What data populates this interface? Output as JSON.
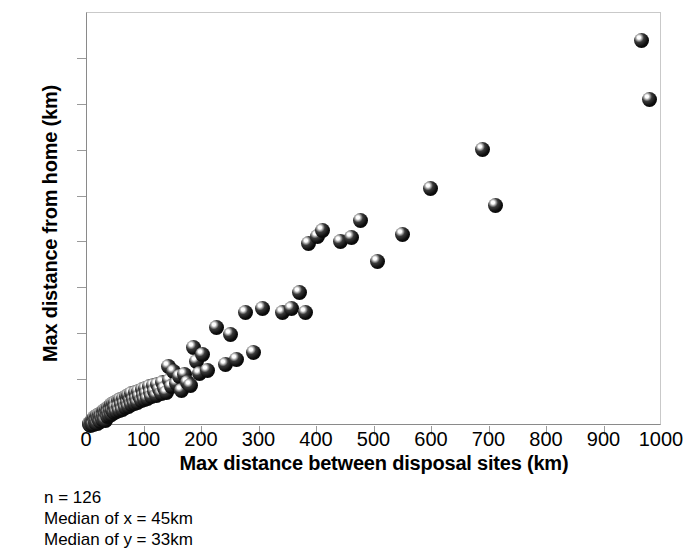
{
  "chart_data": {
    "type": "scatter",
    "title": "",
    "xlabel": "Max distance between disposal sites (km)",
    "ylabel": "Max distance from home (km)",
    "xlim": [
      0,
      1000
    ],
    "ylim": [
      0,
      900
    ],
    "xticks": [
      0,
      100,
      200,
      300,
      400,
      500,
      600,
      700,
      800,
      900,
      1000
    ],
    "yticks": [
      0,
      100,
      200,
      300,
      400,
      500,
      600,
      700,
      800,
      900
    ],
    "grid": false,
    "legend": null,
    "marker_style": "black-3d-sphere",
    "n_points": 126,
    "points": [
      [
        4,
        3
      ],
      [
        5,
        6
      ],
      [
        6,
        2
      ],
      [
        7,
        9
      ],
      [
        8,
        5
      ],
      [
        9,
        12
      ],
      [
        10,
        7
      ],
      [
        11,
        15
      ],
      [
        12,
        4
      ],
      [
        13,
        18
      ],
      [
        14,
        10
      ],
      [
        15,
        8
      ],
      [
        16,
        20
      ],
      [
        17,
        13
      ],
      [
        18,
        6
      ],
      [
        19,
        22
      ],
      [
        20,
        16
      ],
      [
        21,
        11
      ],
      [
        22,
        25
      ],
      [
        23,
        18
      ],
      [
        24,
        9
      ],
      [
        25,
        28
      ],
      [
        26,
        20
      ],
      [
        27,
        14
      ],
      [
        28,
        31
      ],
      [
        29,
        22
      ],
      [
        30,
        17
      ],
      [
        31,
        34
      ],
      [
        32,
        25
      ],
      [
        33,
        12
      ],
      [
        34,
        37
      ],
      [
        35,
        27
      ],
      [
        36,
        20
      ],
      [
        37,
        40
      ],
      [
        38,
        30
      ],
      [
        39,
        23
      ],
      [
        40,
        43
      ],
      [
        41,
        33
      ],
      [
        42,
        26
      ],
      [
        43,
        46
      ],
      [
        44,
        35
      ],
      [
        45,
        33
      ],
      [
        46,
        49
      ],
      [
        47,
        38
      ],
      [
        48,
        29
      ],
      [
        49,
        52
      ],
      [
        50,
        40
      ],
      [
        52,
        31
      ],
      [
        54,
        55
      ],
      [
        55,
        43
      ],
      [
        57,
        34
      ],
      [
        58,
        58
      ],
      [
        60,
        46
      ],
      [
        62,
        37
      ],
      [
        63,
        61
      ],
      [
        65,
        49
      ],
      [
        67,
        40
      ],
      [
        68,
        64
      ],
      [
        70,
        52
      ],
      [
        72,
        43
      ],
      [
        73,
        67
      ],
      [
        75,
        55
      ],
      [
        77,
        46
      ],
      [
        78,
        70
      ],
      [
        80,
        58
      ],
      [
        82,
        49
      ],
      [
        84,
        73
      ],
      [
        86,
        61
      ],
      [
        88,
        52
      ],
      [
        90,
        76
      ],
      [
        92,
        64
      ],
      [
        94,
        55
      ],
      [
        96,
        79
      ],
      [
        98,
        67
      ],
      [
        100,
        58
      ],
      [
        102,
        82
      ],
      [
        104,
        70
      ],
      [
        106,
        61
      ],
      [
        108,
        85
      ],
      [
        110,
        73
      ],
      [
        112,
        64
      ],
      [
        115,
        88
      ],
      [
        118,
        76
      ],
      [
        120,
        67
      ],
      [
        123,
        91
      ],
      [
        126,
        79
      ],
      [
        129,
        70
      ],
      [
        132,
        94
      ],
      [
        135,
        82
      ],
      [
        138,
        73
      ],
      [
        141,
        130
      ],
      [
        144,
        100
      ],
      [
        147,
        85
      ],
      [
        150,
        118
      ],
      [
        155,
        92
      ],
      [
        160,
        108
      ],
      [
        165,
        78
      ],
      [
        170,
        112
      ],
      [
        175,
        95
      ],
      [
        180,
        88
      ],
      [
        185,
        172
      ],
      [
        190,
        140
      ],
      [
        195,
        115
      ],
      [
        200,
        155
      ],
      [
        210,
        122
      ],
      [
        225,
        215
      ],
      [
        240,
        135
      ],
      [
        250,
        200
      ],
      [
        260,
        145
      ],
      [
        275,
        248
      ],
      [
        290,
        160
      ],
      [
        305,
        255
      ],
      [
        340,
        248
      ],
      [
        355,
        255
      ],
      [
        370,
        292
      ],
      [
        380,
        248
      ],
      [
        385,
        398
      ],
      [
        400,
        412
      ],
      [
        410,
        425
      ],
      [
        440,
        402
      ],
      [
        460,
        410
      ],
      [
        475,
        448
      ],
      [
        505,
        358
      ],
      [
        548,
        418
      ],
      [
        598,
        518
      ],
      [
        688,
        602
      ],
      [
        710,
        480
      ],
      [
        965,
        840
      ],
      [
        978,
        712
      ]
    ]
  },
  "caption": {
    "lines": [
      "n = 126",
      "Median of x = 45km",
      "Median of y = 33km"
    ]
  }
}
